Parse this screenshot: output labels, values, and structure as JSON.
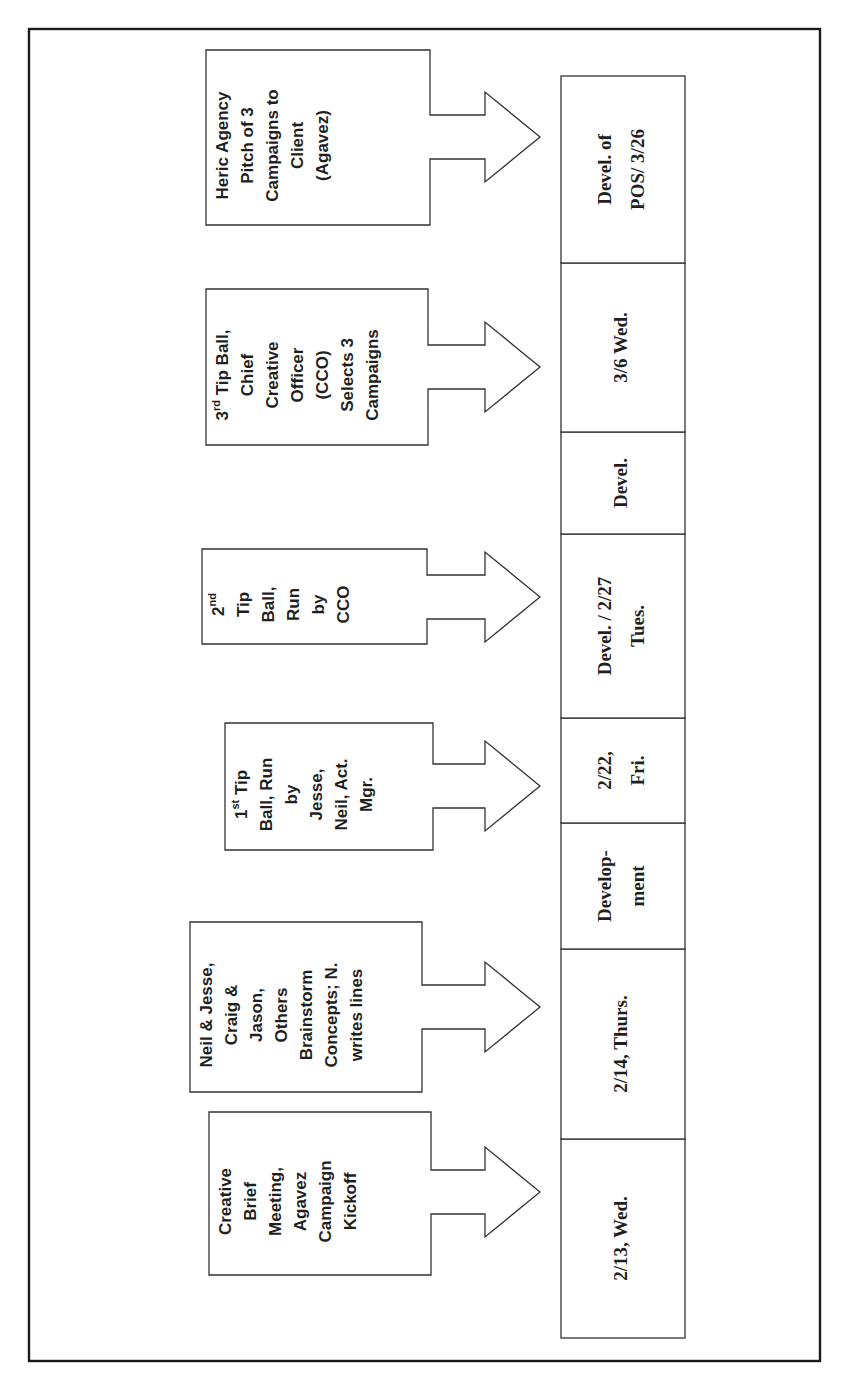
{
  "diagram": {
    "orientation": "rotated-90-ccw",
    "callouts": [
      {
        "id": "kickoff",
        "lines": [
          "Creative",
          "Brief",
          "Meeting,",
          "Agavez",
          "Campaign",
          "Kickoff"
        ],
        "points_to": "2/13, Wed."
      },
      {
        "id": "brainstorm",
        "lines": [
          "Neil & Jesse,",
          "Craig &",
          "Jason,",
          "Others",
          "Brainstorm",
          "Concepts; N.",
          "writes lines"
        ],
        "points_to": "2/14, Thurs."
      },
      {
        "id": "tip-ball-1",
        "lines": [
          "1st Tip",
          "Ball, Run",
          "by",
          "Jesse,",
          "Neil, Act.",
          "Mgr."
        ],
        "superscript": {
          "line": 0,
          "base": "1",
          "sup": "st",
          "rest": " Tip"
        },
        "points_to": "2/22, Fri."
      },
      {
        "id": "tip-ball-2",
        "lines": [
          "2nd",
          "Tip",
          "Ball,",
          "Run",
          "by",
          "CCO"
        ],
        "superscript": {
          "line": 0,
          "base": "2",
          "sup": "nd",
          "rest": ""
        },
        "points_to": "Devel. / 2/27 Tues."
      },
      {
        "id": "tip-ball-3",
        "lines": [
          "3rd Tip Ball,",
          "Chief",
          "Creative",
          "Officer",
          "(CCO)",
          "Selects 3",
          "Campaigns"
        ],
        "superscript": {
          "line": 0,
          "base": "3",
          "sup": "rd",
          "rest": " Tip Ball,"
        },
        "points_to": "3/6 Wed."
      },
      {
        "id": "client-pitch",
        "lines": [
          "Heric Agency",
          "Pitch of 3",
          "Campaigns to",
          "Client",
          "(Agavez)"
        ],
        "points_to": "Devel. of POS/ 3/26"
      }
    ],
    "timeline": [
      {
        "lines": [
          "2/13, Wed."
        ]
      },
      {
        "lines": [
          "2/14, Thurs."
        ]
      },
      {
        "lines": [
          "Develop-",
          "ment"
        ]
      },
      {
        "lines": [
          "2/22,",
          "Fri."
        ]
      },
      {
        "lines": [
          "Devel. / 2/27",
          "Tues."
        ]
      },
      {
        "lines": [
          "Devel."
        ]
      },
      {
        "lines": [
          "3/6 Wed."
        ]
      },
      {
        "lines": [
          "Devel. of",
          "POS/ 3/26"
        ]
      }
    ],
    "colors": {
      "background": "#ffffff",
      "stroke": "#333333",
      "text": "#1f1f1f"
    }
  }
}
